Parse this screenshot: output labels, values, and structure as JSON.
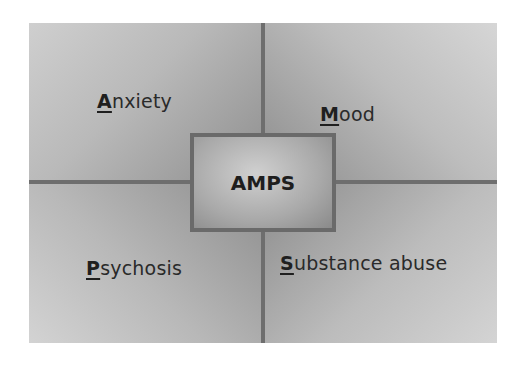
{
  "diagram": {
    "center": {
      "label": "AMPS"
    },
    "quadrants": [
      {
        "id": "top-left",
        "initial": "A",
        "rest": "nxiety",
        "full": "Anxiety"
      },
      {
        "id": "top-right",
        "initial": "M",
        "rest": "ood",
        "full": "Mood"
      },
      {
        "id": "bottom-left",
        "initial": "P",
        "rest": "sychosis",
        "full": "Psychosis"
      },
      {
        "id": "bottom-right",
        "initial": "S",
        "rest": "ubstance abuse",
        "full": "Substance abuse"
      }
    ]
  },
  "colors": {
    "divider": "#6e6e6e",
    "text": "#2a2a2a"
  }
}
